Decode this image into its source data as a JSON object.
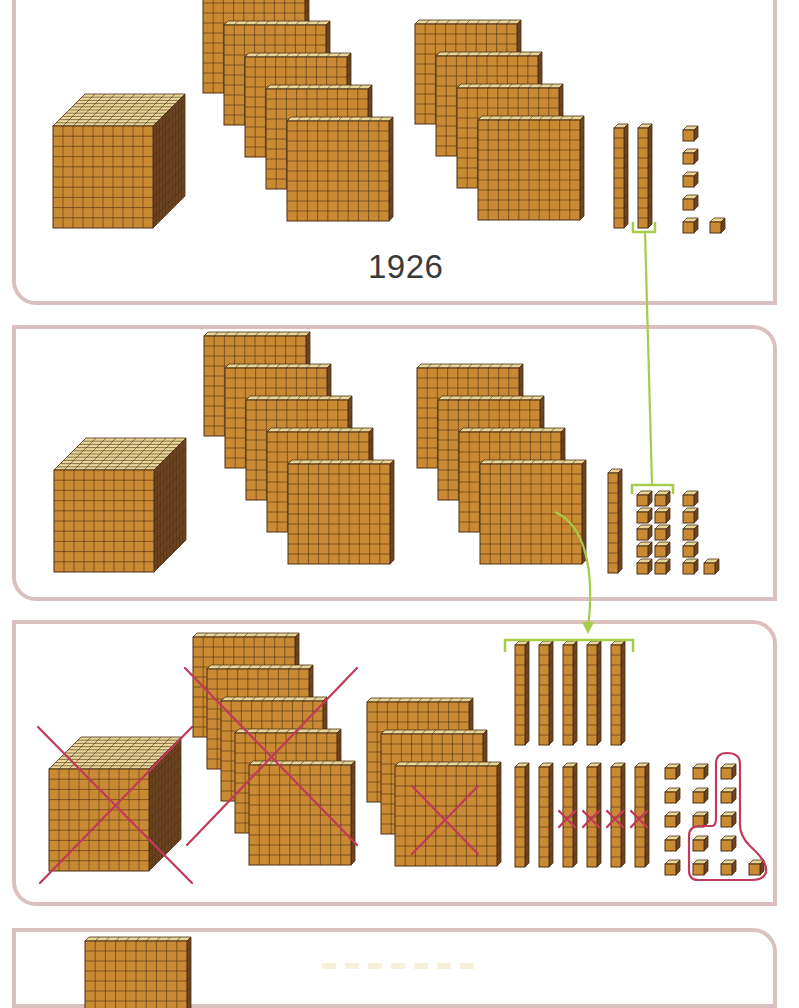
{
  "colors": {
    "block_front": "#c98a33",
    "block_top": "#e8d698",
    "block_side": "#6e4420",
    "block_grid": "#4b2f14",
    "panel_border": "#dcc0c0",
    "connector_green": "#a6cc4a",
    "cross_red": "#c23a5a",
    "label_text": "#3a3a3a"
  },
  "panels": [
    {
      "id": "panel-1",
      "label": "1926",
      "thousands": 1,
      "hundreds": 9,
      "tens": 2,
      "ones": 6,
      "description": "Original number represented by 1 cube, 9 flats, 2 rods, 6 units"
    },
    {
      "id": "panel-2",
      "thousands": 1,
      "hundreds": 9,
      "tens": 1,
      "ones": 16,
      "description": "One ten regrouped into 10 ones"
    },
    {
      "id": "panel-3",
      "thousands": 1,
      "hundreds": 8,
      "tens": 11,
      "ones": 16,
      "crossed_out": {
        "thousands": 1,
        "hundreds": 6,
        "tens": 4,
        "ones": 8
      },
      "description": "One hundred regrouped into 10 tens; subtraction shown with red crosses and circled units"
    },
    {
      "id": "panel-4",
      "description": "Result panel (partially visible)"
    }
  ]
}
